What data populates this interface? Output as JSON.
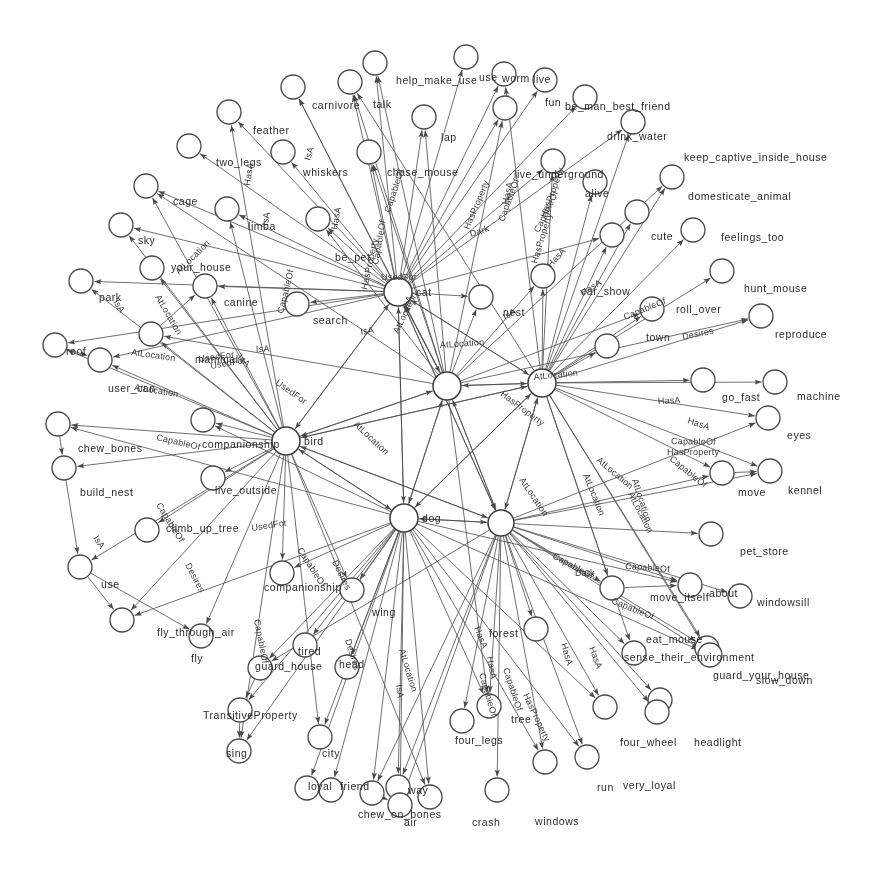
{
  "figure": {
    "type": "knowledge-graph",
    "background": "#ffffff",
    "node_stroke": "#4a4a4a",
    "edge_stroke": "#555555",
    "text_color": "#2b2b2b",
    "width": 875,
    "height": 874
  },
  "relations": [
    "IsA",
    "AtLocation",
    "CapableOf",
    "HasA",
    "HasProperty",
    "UsedFor",
    "Desires",
    "TransitiveProperty",
    "Dark"
  ],
  "hubs": [
    {
      "id": "cat",
      "label": "cat",
      "x": 398,
      "y": 292,
      "r": 14
    },
    {
      "id": "bird",
      "label": "bird",
      "x": 286,
      "y": 441,
      "r": 14
    },
    {
      "id": "dog",
      "label": "dog",
      "x": 404,
      "y": 518,
      "r": 14
    },
    {
      "id": "n_c1",
      "label": "",
      "x": 447,
      "y": 386,
      "r": 14
    },
    {
      "id": "n_c2",
      "label": "",
      "x": 542,
      "y": 383,
      "r": 14
    },
    {
      "id": "car",
      "label": "",
      "x": 501,
      "y": 523,
      "r": 13
    }
  ],
  "nodes": [
    {
      "id": "n01",
      "label": "help_make_use",
      "x": 375,
      "y": 63,
      "lx": 396,
      "ly": 84,
      "r": 12
    },
    {
      "id": "n02",
      "label": "use",
      "x": 466,
      "y": 57,
      "lx": 479,
      "ly": 81,
      "r": 12
    },
    {
      "id": "n03",
      "label": "worm",
      "x": 504,
      "y": 74,
      "lx": 502,
      "ly": 82,
      "r": 12
    },
    {
      "id": "n04",
      "label": "live",
      "x": 545,
      "y": 80,
      "lx": 533,
      "ly": 83,
      "r": 12
    },
    {
      "id": "n05",
      "label": "carnivore",
      "x": 293,
      "y": 87,
      "lx": 312,
      "ly": 109,
      "r": 12
    },
    {
      "id": "n06",
      "label": "talk",
      "x": 350,
      "y": 82,
      "lx": 373,
      "ly": 108,
      "r": 12
    },
    {
      "id": "n07",
      "label": "fun",
      "x": 505,
      "y": 108,
      "lx": 545,
      "ly": 106,
      "r": 12
    },
    {
      "id": "n08",
      "label": "be_man_best_friend",
      "x": 585,
      "y": 97,
      "lx": 565,
      "ly": 110,
      "r": 12
    },
    {
      "id": "n09",
      "label": "drink_water",
      "x": 633,
      "y": 122,
      "lx": 607,
      "ly": 140,
      "r": 12
    },
    {
      "id": "n10",
      "label": "feather",
      "x": 229,
      "y": 112,
      "lx": 253,
      "ly": 134,
      "r": 12
    },
    {
      "id": "n11",
      "label": "lap",
      "x": 424,
      "y": 117,
      "lx": 441,
      "ly": 141,
      "r": 12
    },
    {
      "id": "n12",
      "label": "keep_captive_inside_house",
      "x": 672,
      "y": 177,
      "lx": 684,
      "ly": 161,
      "r": 12
    },
    {
      "id": "n13",
      "label": "two_legs",
      "x": 189,
      "y": 146,
      "lx": 216,
      "ly": 166,
      "r": 12
    },
    {
      "id": "n14",
      "label": "whiskers",
      "x": 283,
      "y": 152,
      "lx": 303,
      "ly": 176,
      "r": 12
    },
    {
      "id": "n15",
      "label": "chase_mouse",
      "x": 369,
      "y": 152,
      "lx": 387,
      "ly": 176,
      "r": 12
    },
    {
      "id": "n16",
      "label": "live_underground",
      "x": 553,
      "y": 161,
      "lx": 514,
      "ly": 178,
      "r": 12
    },
    {
      "id": "n17",
      "label": "alive",
      "x": 595,
      "y": 182,
      "lx": 585,
      "ly": 197,
      "r": 12
    },
    {
      "id": "n18",
      "label": "domesticate_animal",
      "x": 637,
      "y": 212,
      "lx": 688,
      "ly": 200,
      "r": 12
    },
    {
      "id": "n19",
      "label": "cage",
      "x": 146,
      "y": 186,
      "lx": 173,
      "ly": 205,
      "r": 12
    },
    {
      "id": "n20",
      "label": "limba",
      "x": 227,
      "y": 209,
      "lx": 248,
      "ly": 230,
      "r": 12
    },
    {
      "id": "n21",
      "label": "sky",
      "x": 121,
      "y": 225,
      "lx": 138,
      "ly": 244,
      "r": 12
    },
    {
      "id": "n22",
      "label": "cute",
      "x": 612,
      "y": 235,
      "lx": 651,
      "ly": 240,
      "r": 12
    },
    {
      "id": "n23",
      "label": "feelings_too",
      "x": 693,
      "y": 230,
      "lx": 721,
      "ly": 241,
      "r": 12
    },
    {
      "id": "n24",
      "label": "be_pet",
      "x": 318,
      "y": 219,
      "lx": 335,
      "ly": 261,
      "r": 12
    },
    {
      "id": "n25",
      "label": "your_house",
      "x": 152,
      "y": 268,
      "lx": 171,
      "ly": 271,
      "r": 12
    },
    {
      "id": "n26",
      "label": "park",
      "x": 81,
      "y": 281,
      "lx": 99,
      "ly": 301,
      "r": 12
    },
    {
      "id": "n27",
      "label": "canine",
      "x": 205,
      "y": 286,
      "lx": 224,
      "ly": 306,
      "r": 12
    },
    {
      "id": "n28",
      "label": "car_show",
      "x": 543,
      "y": 276,
      "lx": 581,
      "ly": 295,
      "r": 12
    },
    {
      "id": "n29",
      "label": "hunt_mouse",
      "x": 722,
      "y": 271,
      "lx": 744,
      "ly": 292,
      "r": 12
    },
    {
      "id": "n30",
      "label": "reproduce",
      "x": 761,
      "y": 316,
      "lx": 775,
      "ly": 338,
      "r": 12
    },
    {
      "id": "n31",
      "label": "roll_over",
      "x": 652,
      "y": 309,
      "lx": 676,
      "ly": 313,
      "r": 12
    },
    {
      "id": "n32",
      "label": "nest",
      "x": 481,
      "y": 297,
      "lx": 503,
      "ly": 316,
      "r": 12
    },
    {
      "id": "n33",
      "label": "search",
      "x": 297,
      "y": 304,
      "lx": 313,
      "ly": 324,
      "r": 12
    },
    {
      "id": "n34",
      "label": "mammal",
      "x": 151,
      "y": 334,
      "lx": 195,
      "ly": 363,
      "r": 12
    },
    {
      "id": "n35",
      "label": "roof",
      "x": 55,
      "y": 345,
      "lx": 66,
      "ly": 355,
      "r": 12
    },
    {
      "id": "n36",
      "label": "user_can",
      "x": 100,
      "y": 360,
      "lx": 108,
      "ly": 392,
      "r": 12
    },
    {
      "id": "n37",
      "label": "town",
      "x": 607,
      "y": 346,
      "lx": 646,
      "ly": 341,
      "r": 12
    },
    {
      "id": "n38",
      "label": "go_fast",
      "x": 703,
      "y": 380,
      "lx": 722,
      "ly": 401,
      "r": 12
    },
    {
      "id": "n39",
      "label": "machine",
      "x": 775,
      "y": 382,
      "lx": 797,
      "ly": 400,
      "r": 12
    },
    {
      "id": "n40",
      "label": "eyes",
      "x": 768,
      "y": 418,
      "lx": 787,
      "ly": 439,
      "r": 12
    },
    {
      "id": "n41",
      "label": "chew_bones",
      "x": 58,
      "y": 424,
      "lx": 78,
      "ly": 452,
      "r": 12
    },
    {
      "id": "n42",
      "label": "companionship",
      "x": 203,
      "y": 420,
      "lx": 202,
      "ly": 448,
      "r": 12
    },
    {
      "id": "n43",
      "label": "move",
      "x": 722,
      "y": 473,
      "lx": 738,
      "ly": 496,
      "r": 12
    },
    {
      "id": "n44",
      "label": "kennel",
      "x": 770,
      "y": 471,
      "lx": 788,
      "ly": 494,
      "r": 12
    },
    {
      "id": "n45",
      "label": "build_nest",
      "x": 64,
      "y": 468,
      "lx": 80,
      "ly": 496,
      "r": 12
    },
    {
      "id": "n46",
      "label": "live_outside",
      "x": 213,
      "y": 478,
      "lx": 215,
      "ly": 494,
      "r": 12
    },
    {
      "id": "n47",
      "label": "pet_store",
      "x": 711,
      "y": 534,
      "lx": 740,
      "ly": 555,
      "r": 12
    },
    {
      "id": "n48",
      "label": "climb_up_tree",
      "x": 147,
      "y": 530,
      "lx": 166,
      "ly": 532,
      "r": 12
    },
    {
      "id": "n49",
      "label": "use",
      "x": 80,
      "y": 567,
      "lx": 101,
      "ly": 588,
      "r": 12
    },
    {
      "id": "n50",
      "label": "move_itself",
      "x": 612,
      "y": 588,
      "lx": 650,
      "ly": 601,
      "r": 12
    },
    {
      "id": "n51",
      "label": "about",
      "x": 690,
      "y": 585,
      "lx": 709,
      "ly": 597,
      "r": 12
    },
    {
      "id": "n52",
      "label": "windowsill",
      "x": 740,
      "y": 596,
      "lx": 757,
      "ly": 606,
      "r": 12
    },
    {
      "id": "n53",
      "label": "companionship",
      "x": 282,
      "y": 573,
      "lx": 264,
      "ly": 591,
      "r": 12
    },
    {
      "id": "n54",
      "label": "fly_through_air",
      "x": 122,
      "y": 620,
      "lx": 157,
      "ly": 636,
      "r": 12
    },
    {
      "id": "n55",
      "label": "fly",
      "x": 201,
      "y": 636,
      "lx": 191,
      "ly": 662,
      "r": 12
    },
    {
      "id": "n56",
      "label": "wing",
      "x": 352,
      "y": 590,
      "lx": 372,
      "ly": 616,
      "r": 12
    },
    {
      "id": "n57",
      "label": "forest",
      "x": 536,
      "y": 629,
      "lx": 489,
      "ly": 637,
      "r": 12
    },
    {
      "id": "n58",
      "label": "sense_their_environment",
      "x": 634,
      "y": 653,
      "lx": 624,
      "ly": 661,
      "r": 12
    },
    {
      "id": "n59",
      "label": "eat_mouse",
      "x": 707,
      "y": 648,
      "lx": 646,
      "ly": 643,
      "r": 12
    },
    {
      "id": "n60",
      "label": "slow_down",
      "x": 710,
      "y": 655,
      "lx": 756,
      "ly": 684,
      "r": 12
    },
    {
      "id": "n61",
      "label": "guard_your_house",
      "x": 660,
      "y": 700,
      "lx": 713,
      "ly": 679,
      "r": 12
    },
    {
      "id": "n62",
      "label": "guard_house",
      "x": 260,
      "y": 668,
      "lx": 255,
      "ly": 670,
      "r": 12
    },
    {
      "id": "n63",
      "label": "tired",
      "x": 305,
      "y": 645,
      "lx": 298,
      "ly": 655,
      "r": 12
    },
    {
      "id": "n64",
      "label": "TransitiveProperty",
      "x": 240,
      "y": 710,
      "lx": 203,
      "ly": 719,
      "r": 12
    },
    {
      "id": "n65",
      "label": "sing",
      "x": 239,
      "y": 751,
      "lx": 226,
      "ly": 757,
      "r": 12
    },
    {
      "id": "n66",
      "label": "city",
      "x": 320,
      "y": 737,
      "lx": 322,
      "ly": 757,
      "r": 12
    },
    {
      "id": "n67",
      "label": "loyal",
      "x": 307,
      "y": 788,
      "lx": 308,
      "ly": 790,
      "r": 12
    },
    {
      "id": "n68",
      "label": "friend",
      "x": 331,
      "y": 790,
      "lx": 340,
      "ly": 790,
      "r": 12
    },
    {
      "id": "n69",
      "label": "chew_on_bones",
      "x": 372,
      "y": 793,
      "lx": 358,
      "ly": 818,
      "r": 12
    },
    {
      "id": "n70",
      "label": "way",
      "x": 398,
      "y": 787,
      "lx": 408,
      "ly": 794,
      "r": 12
    },
    {
      "id": "n71",
      "label": "air",
      "x": 400,
      "y": 805,
      "lx": 404,
      "ly": 826,
      "r": 12
    },
    {
      "id": "n72",
      "label": "crash",
      "x": 430,
      "y": 797,
      "lx": 472,
      "ly": 826,
      "r": 12
    },
    {
      "id": "n73",
      "label": "windows",
      "x": 497,
      "y": 790,
      "lx": 535,
      "ly": 825,
      "r": 12
    },
    {
      "id": "n74",
      "label": "four_legs",
      "x": 462,
      "y": 721,
      "lx": 455,
      "ly": 744,
      "r": 12
    },
    {
      "id": "n75",
      "label": "tree",
      "x": 489,
      "y": 706,
      "lx": 511,
      "ly": 723,
      "r": 12
    },
    {
      "id": "n76",
      "label": "run",
      "x": 545,
      "y": 762,
      "lx": 597,
      "ly": 791,
      "r": 12
    },
    {
      "id": "n77",
      "label": "very_loyal",
      "x": 587,
      "y": 757,
      "lx": 623,
      "ly": 789,
      "r": 12
    },
    {
      "id": "n78",
      "label": "four_wheel",
      "x": 605,
      "y": 707,
      "lx": 620,
      "ly": 746,
      "r": 12
    },
    {
      "id": "n79",
      "label": "headlight",
      "x": 657,
      "y": 712,
      "lx": 694,
      "ly": 746,
      "r": 12
    },
    {
      "id": "n80",
      "label": "head",
      "x": 347,
      "y": 667,
      "lx": 339,
      "ly": 668,
      "r": 12
    }
  ],
  "edge_labels": [
    {
      "text": "CapableOf",
      "x": 390,
      "y": 213,
      "rot": -72
    },
    {
      "text": "CapableOf",
      "x": 378,
      "y": 265,
      "rot": -80
    },
    {
      "text": "CapableOf",
      "x": 283,
      "y": 314,
      "rot": -76
    },
    {
      "text": "CapableOf",
      "x": 539,
      "y": 233,
      "rot": -64
    },
    {
      "text": "CapableOf",
      "x": 504,
      "y": 222,
      "rot": -70
    },
    {
      "text": "CapableOf",
      "x": 625,
      "y": 320,
      "rot": -22
    },
    {
      "text": "CapableOf",
      "x": 156,
      "y": 505,
      "rot": 58
    },
    {
      "text": "CapableOf",
      "x": 254,
      "y": 620,
      "rot": 79
    },
    {
      "text": "CapableOf",
      "x": 297,
      "y": 550,
      "rot": 57
    },
    {
      "text": "CapableOf",
      "x": 552,
      "y": 558,
      "rot": 28
    },
    {
      "text": "CapableOf",
      "x": 611,
      "y": 603,
      "rot": 22
    },
    {
      "text": "CapableOf",
      "x": 669,
      "y": 460,
      "rot": 39
    },
    {
      "text": "CapableOf",
      "x": 671,
      "y": 444,
      "rot": 1
    },
    {
      "text": "CapableOf",
      "x": 479,
      "y": 674,
      "rot": 74
    },
    {
      "text": "CapableOf",
      "x": 503,
      "y": 669,
      "rot": 72
    },
    {
      "text": "CapableOf",
      "x": 156,
      "y": 440,
      "rot": 13
    },
    {
      "text": "CapableOf",
      "x": 625,
      "y": 569,
      "rot": 4
    },
    {
      "text": "HasA",
      "x": 250,
      "y": 186,
      "rot": -82
    },
    {
      "text": "HasA",
      "x": 337,
      "y": 230,
      "rot": -80
    },
    {
      "text": "HasA",
      "x": 508,
      "y": 205,
      "rot": -78
    },
    {
      "text": "HasA",
      "x": 551,
      "y": 268,
      "rot": -48
    },
    {
      "text": "HasA",
      "x": 583,
      "y": 296,
      "rot": -32
    },
    {
      "text": "HasA",
      "x": 658,
      "y": 404,
      "rot": -3
    },
    {
      "text": "HasA",
      "x": 687,
      "y": 423,
      "rot": 18
    },
    {
      "text": "HasA",
      "x": 561,
      "y": 644,
      "rot": 74
    },
    {
      "text": "HasA",
      "x": 589,
      "y": 648,
      "rot": 70
    },
    {
      "text": "HasA",
      "x": 487,
      "y": 657,
      "rot": 80
    },
    {
      "text": "HasA",
      "x": 474,
      "y": 628,
      "rot": 68
    },
    {
      "text": "IsA",
      "x": 310,
      "y": 161,
      "rot": -73
    },
    {
      "text": "IsA",
      "x": 361,
      "y": 335,
      "rot": -10
    },
    {
      "text": "IsA",
      "x": 256,
      "y": 352,
      "rot": -2
    },
    {
      "text": "IsA",
      "x": 237,
      "y": 358,
      "rot": 45
    },
    {
      "text": "IsA",
      "x": 505,
      "y": 320,
      "rot": -30
    },
    {
      "text": "IsA",
      "x": 408,
      "y": 310,
      "rot": -69
    },
    {
      "text": "IsA",
      "x": 113,
      "y": 302,
      "rot": 58
    },
    {
      "text": "IsA",
      "x": 93,
      "y": 538,
      "rot": 57
    },
    {
      "text": "IsA",
      "x": 396,
      "y": 685,
      "rot": 82
    },
    {
      "text": "IsA",
      "x": 268,
      "y": 226,
      "rot": -83
    },
    {
      "text": "AtLocation",
      "x": 179,
      "y": 275,
      "rot": -45
    },
    {
      "text": "AtLocation",
      "x": 155,
      "y": 297,
      "rot": 60
    },
    {
      "text": "AtLocation",
      "x": 131,
      "y": 355,
      "rot": 8
    },
    {
      "text": "AtLocation",
      "x": 134,
      "y": 390,
      "rot": 9
    },
    {
      "text": "AtLocation",
      "x": 398,
      "y": 334,
      "rot": -64
    },
    {
      "text": "AtLocation",
      "x": 353,
      "y": 425,
      "rot": 43
    },
    {
      "text": "AtLocation",
      "x": 440,
      "y": 348,
      "rot": -4
    },
    {
      "text": "AtLocation",
      "x": 534,
      "y": 380,
      "rot": -6
    },
    {
      "text": "AtLocation",
      "x": 583,
      "y": 475,
      "rot": 68
    },
    {
      "text": "AtLocation",
      "x": 632,
      "y": 480,
      "rot": 72
    },
    {
      "text": "AtLocation",
      "x": 596,
      "y": 461,
      "rot": 40
    },
    {
      "text": "AtLocation",
      "x": 628,
      "y": 494,
      "rot": 63
    },
    {
      "text": "AtLocation",
      "x": 399,
      "y": 650,
      "rot": 73
    },
    {
      "text": "AtLocation",
      "x": 519,
      "y": 480,
      "rot": 56
    },
    {
      "text": "HasProperty",
      "x": 469,
      "y": 230,
      "rot": -67
    },
    {
      "text": "HasProperty",
      "x": 546,
      "y": 218,
      "rot": -70
    },
    {
      "text": "HasProperty",
      "x": 537,
      "y": 264,
      "rot": -73
    },
    {
      "text": "HasProperty",
      "x": 500,
      "y": 395,
      "rot": 37
    },
    {
      "text": "HasProperty",
      "x": 667,
      "y": 455,
      "rot": 0
    },
    {
      "text": "HasProperty",
      "x": 523,
      "y": 695,
      "rot": 65
    },
    {
      "text": "HasProperty",
      "x": 367,
      "y": 290,
      "rot": -78
    },
    {
      "text": "UsedFor",
      "x": 381,
      "y": 280,
      "rot": 0
    },
    {
      "text": "UsedFor",
      "x": 199,
      "y": 362,
      "rot": -8
    },
    {
      "text": "UsedFor",
      "x": 211,
      "y": 369,
      "rot": -10
    },
    {
      "text": "UsedFor",
      "x": 252,
      "y": 531,
      "rot": -9
    },
    {
      "text": "UsedFor",
      "x": 275,
      "y": 384,
      "rot": 35
    },
    {
      "text": "Desires",
      "x": 683,
      "y": 340,
      "rot": -12
    },
    {
      "text": "Desires",
      "x": 185,
      "y": 565,
      "rot": 62
    },
    {
      "text": "Desires",
      "x": 345,
      "y": 640,
      "rot": 73
    },
    {
      "text": "Desires",
      "x": 332,
      "y": 562,
      "rot": 64
    },
    {
      "text": "Dark",
      "x": 471,
      "y": 237,
      "rot": -18
    },
    {
      "text": "Dark",
      "x": 575,
      "y": 576,
      "rot": 0
    }
  ]
}
